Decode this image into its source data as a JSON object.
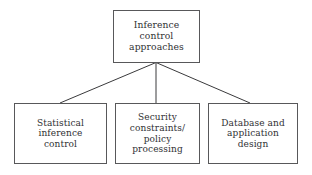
{
  "diagram": {
    "background_color": "#ffffff",
    "border_color": "#58585a",
    "text_color": "#2f2f33",
    "connector_color": "#3a3a3c",
    "root": {
      "label": "Inference\ncontrol\napproaches"
    },
    "children": [
      {
        "label": "Statistical\ninference\ncontrol"
      },
      {
        "label": "Security\nconstraints/\npolicy\nprocessing"
      },
      {
        "label": "Database and\napplication\ndesign"
      }
    ]
  }
}
